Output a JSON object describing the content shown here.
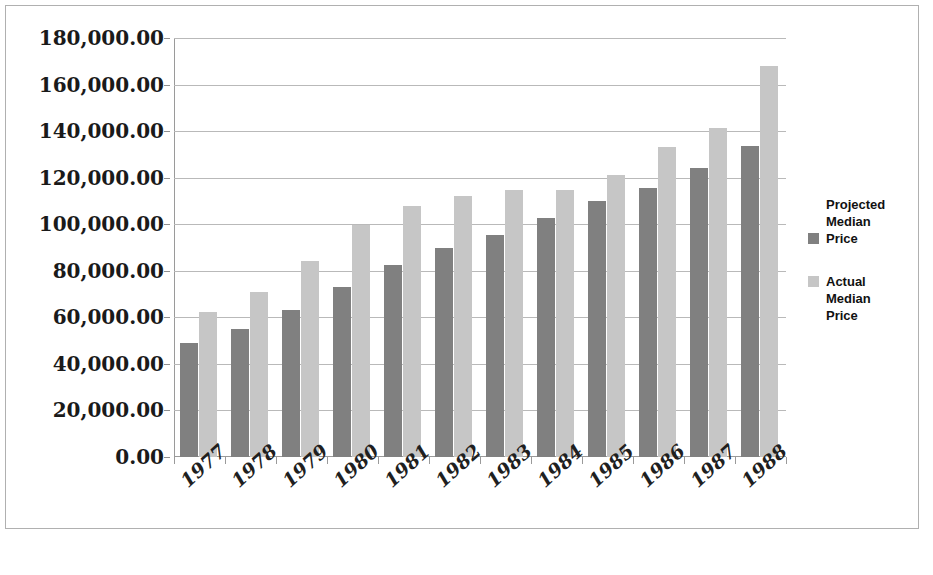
{
  "chart_data": {
    "type": "bar",
    "title": "",
    "subtitle": "",
    "xlabel": "",
    "ylabel": "",
    "categories": [
      "1977",
      "1978",
      "1979",
      "1980",
      "1981",
      "1982",
      "1983",
      "1984",
      "1985",
      "1986",
      "1987",
      "1988"
    ],
    "series": [
      {
        "name": "Projected Median Price",
        "color": "#808080",
        "values": [
          49000,
          55000,
          63000,
          73000,
          82500,
          90000,
          95500,
          102500,
          110000,
          115500,
          124000,
          133500
        ]
      },
      {
        "name": "Actual Median Price",
        "color": "#c6c6c6",
        "values": [
          62500,
          71000,
          84000,
          99500,
          108000,
          112000,
          114500,
          114500,
          121000,
          133000,
          141500,
          168000
        ]
      }
    ],
    "ylim": [
      0,
      180000
    ],
    "ytick_step": 20000,
    "ytick_labels": [
      "180,000.00",
      "160,000.00",
      "140,000.00",
      "120,000.00",
      "100,000.00",
      "80,000.00",
      "60,000.00",
      "40,000.00",
      "20,000.00",
      "0.00"
    ],
    "grid": true,
    "grid_axis": "y",
    "legend_position": "right",
    "legend_entries": [
      {
        "label_lines": [
          "Projected",
          "Median",
          "Price"
        ],
        "color": "#808080"
      },
      {
        "label_lines": [
          "Actual",
          "Median",
          "Price"
        ],
        "color": "#c6c6c6"
      }
    ],
    "xtick_rotation": -42
  },
  "frame": {
    "border_color": "#b0b0b0",
    "background": "#ffffff"
  }
}
